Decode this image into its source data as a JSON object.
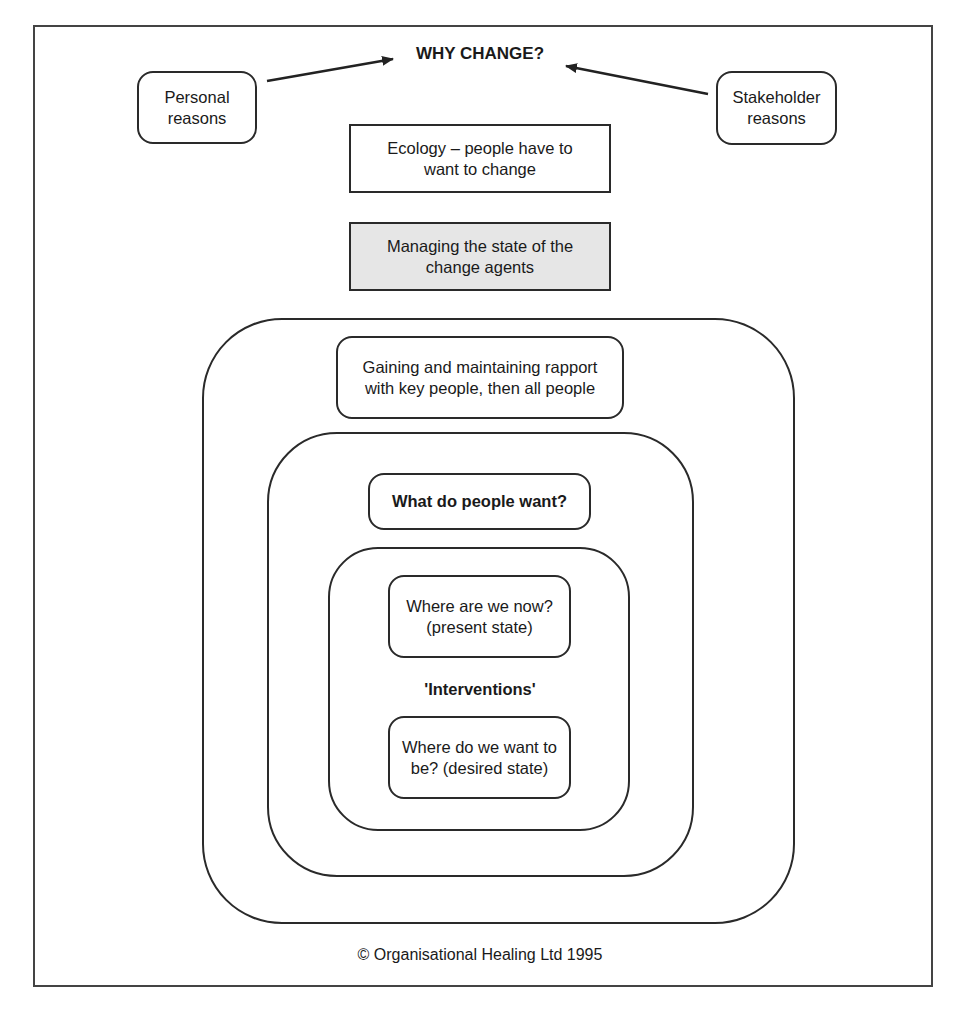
{
  "title": "WHY CHANGE?",
  "inputs": {
    "left": "Personal reasons",
    "right": "Stakeholder reasons"
  },
  "ecology": "Ecology – people have to want to change",
  "managing": "Managing the state of the change agents",
  "rings": {
    "outer": "Gaining and maintaining rapport with key people, then all people",
    "middle": "What do people want?",
    "inner": {
      "present": "Where are we now? (present state)",
      "interventions": "'Interventions'",
      "desired": "Where do we want to be? (desired state)"
    }
  },
  "copyright": "© Organisational Healing Ltd 1995",
  "colors": {
    "line": "#2a2a2a",
    "highlight_fill": "#e6e6e6"
  }
}
